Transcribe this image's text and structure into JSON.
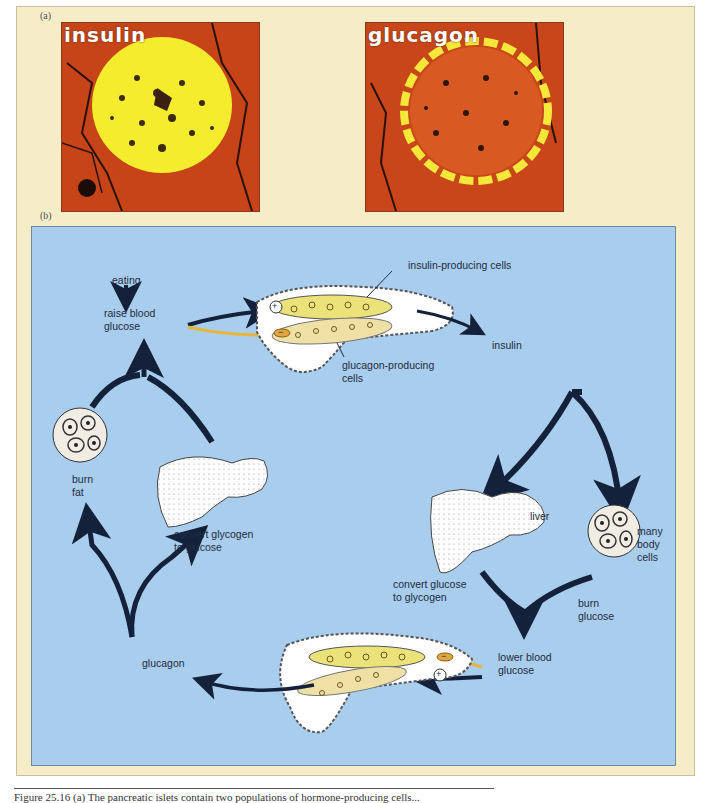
{
  "panel_a": {
    "label": "(a)",
    "images": [
      {
        "tag": "insulin",
        "description": "micrograph of pancreatic islet stained for insulin (bright yellow center)"
      },
      {
        "tag": "glucagon",
        "description": "micrograph of pancreatic islet stained for glucagon (yellow rim)"
      }
    ]
  },
  "panel_b": {
    "label": "(b)",
    "labels": {
      "eating": "eating",
      "raise_blood_glucose": "raise blood\nglucose",
      "insulin_producing_cells": "insulin-producing cells",
      "glucagon_producing_cells": "glucagon-producing\ncells",
      "insulin": "insulin",
      "burn_fat": "burn\nfat",
      "convert_glycogen_to_glucose": "convert glycogen\nto glucose",
      "liver": "liver",
      "many_body_cells": "many\nbody\ncells",
      "convert_glucose_to_glycogen": "convert glucose\nto glycogen",
      "burn_glucose": "burn\nglucose",
      "lower_blood_glucose": "lower blood\nglucose",
      "glucagon": "glucagon"
    },
    "signs": {
      "plus": "+",
      "minus": "−"
    }
  },
  "caption": "Figure 25.16 (a) The pancreatic islets contain two populations of hormone-producing cells...",
  "colors": {
    "frame": "#f5ecc8",
    "diagram_bg": "#a9cdec",
    "tissue": "#c9461a",
    "stain": "#f5e83a",
    "arrow": "#14213a",
    "insulin_cells": "#ece27a",
    "glucagon_cells": "#efe0a6"
  }
}
